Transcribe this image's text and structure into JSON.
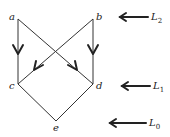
{
  "diagram": {
    "nodes": [
      {
        "id": "a",
        "label": "a",
        "x": 18,
        "y": 19
      },
      {
        "id": "b",
        "label": "b",
        "x": 93,
        "y": 19
      },
      {
        "id": "c",
        "label": "c",
        "x": 18,
        "y": 84
      },
      {
        "id": "d",
        "label": "d",
        "x": 93,
        "y": 84
      },
      {
        "id": "e",
        "label": "e",
        "x": 56,
        "y": 121
      }
    ],
    "edges": [
      {
        "from": "a",
        "to": "c",
        "arrow": true
      },
      {
        "from": "b",
        "to": "d",
        "arrow": true
      },
      {
        "from": "a",
        "to": "d",
        "arrow": true
      },
      {
        "from": "b",
        "to": "c",
        "arrow": true
      },
      {
        "from": "c",
        "to": "e",
        "arrow": false
      },
      {
        "from": "d",
        "to": "e",
        "arrow": false
      }
    ],
    "levels": [
      {
        "name": "L",
        "sub": "2",
        "y": 17
      },
      {
        "name": "L",
        "sub": "1",
        "y": 86
      },
      {
        "name": "L",
        "sub": "0",
        "y": 123
      }
    ]
  }
}
